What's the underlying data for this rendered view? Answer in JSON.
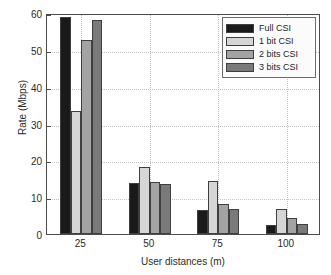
{
  "chart_data": {
    "type": "bar",
    "title": "",
    "xlabel": "User distances (m)",
    "ylabel": "Rate (Mbps)",
    "categories": [
      "25",
      "50",
      "75",
      "100"
    ],
    "series": [
      {
        "name": "Full CSI",
        "color": "#1a1a1a",
        "values": [
          59.0,
          13.9,
          6.5,
          2.5
        ]
      },
      {
        "name": "1 bit CSI",
        "color": "#d6d6d6",
        "values": [
          33.5,
          18.2,
          14.5,
          6.9
        ]
      },
      {
        "name": "2 bits CSI",
        "color": "#a3a3a3",
        "values": [
          52.6,
          14.2,
          8.1,
          4.4
        ]
      },
      {
        "name": "3 bits CSI",
        "color": "#7a7a7a",
        "values": [
          58.0,
          13.6,
          6.9,
          2.8
        ]
      }
    ],
    "ylim": [
      0,
      60
    ],
    "yticks": [
      0,
      10,
      20,
      30,
      40,
      50,
      60
    ],
    "ytick_labels": [
      "0",
      "10",
      "20",
      "30",
      "40",
      "50",
      "60"
    ],
    "grid": true,
    "grid_style": "dotted",
    "legend_position": "upper right"
  }
}
